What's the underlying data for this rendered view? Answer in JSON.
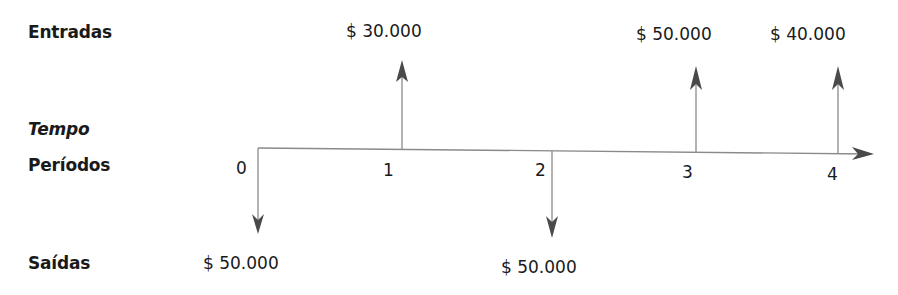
{
  "labels": {
    "inflows": "Entradas",
    "time": "Tempo",
    "periods": "Períodos",
    "outflows": "Saídas"
  },
  "periods": [
    "0",
    "1",
    "2",
    "3",
    "4"
  ],
  "cash_flows": {
    "inflows": [
      {
        "period": "1",
        "amount": "$ 30.000"
      },
      {
        "period": "3",
        "amount": "$ 50.000"
      },
      {
        "period": "4",
        "amount": "$ 40.000"
      }
    ],
    "outflows": [
      {
        "period": "0",
        "amount": "$ 50.000"
      },
      {
        "period": "2",
        "amount": "$ 50.000"
      }
    ]
  },
  "colors": {
    "text": "#1a1a1a",
    "line": "#8a8a8a",
    "arrowhead": "#4a4a4a"
  }
}
